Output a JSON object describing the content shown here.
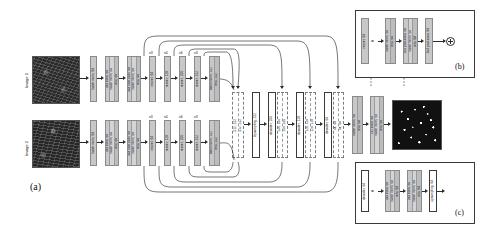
{
  "figure": {
    "type": "neural-network-architecture-diagram",
    "panels": [
      {
        "id": "a",
        "label": "(a)"
      },
      {
        "id": "b",
        "label": "(b)"
      },
      {
        "id": "c",
        "label": "(c)"
      }
    ]
  },
  "inputs": [
    {
      "name": "image-1",
      "label": "Image 1"
    },
    {
      "name": "image-2",
      "label": "Image 2"
    }
  ],
  "encoder": {
    "stem": [
      {
        "lines": [
          "batch norm, 64"
        ]
      },
      {
        "lines": [
          "3x3 conv, 64",
          "batch norm, 64",
          "relu, 64"
        ]
      },
      {
        "lines": [
          "3x3 post-pool, 64",
          "batch norm, 64",
          "relu, 64"
        ]
      }
    ],
    "stages": [
      {
        "label": "resnet, 64",
        "repeat": "x3"
      },
      {
        "label": "resnet, 128",
        "repeat": "x4"
      },
      {
        "label": "resnet, 256",
        "repeat": "x6"
      },
      {
        "label": "resnet, 512",
        "repeat": "x3"
      }
    ],
    "tail": {
      "lines": [
        "batch norm, 512",
        "relu, 512"
      ]
    }
  },
  "bridge": {
    "concat": {
      "lines": [
        "512, 512"
      ]
    },
    "upsample": {
      "label": "Upsampling, 512"
    }
  },
  "decoder": [
    {
      "decoder": "decoder, 256",
      "concat": [
        "256, 256"
      ]
    },
    {
      "decoder": "decoder, 128",
      "concat": [
        "128, 128"
      ]
    },
    {
      "decoder": "decoder, 64",
      "concat": [
        "64, 64"
      ]
    }
  ],
  "head": [
    {
      "lines": [
        "batch norm, 64",
        "relu, 64"
      ]
    },
    {
      "lines": [
        "1x1 conv, 64",
        "batch norm, 64",
        "relu, 64"
      ]
    }
  ],
  "output": {
    "name": "output-map"
  },
  "panel_b": {
    "title": "resnet, 64",
    "equals": "=",
    "blocks": [
      {
        "lines": [
          "batch norm, 64",
          "relu, 64"
        ]
      },
      {
        "lines": [
          "3x3 post-conv, 64",
          "batch norm, 64",
          "relu, 64"
        ]
      },
      {
        "lines": [
          "3x3 post-conv, 64"
        ]
      }
    ],
    "sum_icon": "plus-circle-icon"
  },
  "panel_c": {
    "title": "decoder, 64",
    "equals": "=",
    "blocks": [
      {
        "lines": [
          "3x3 conv, 64",
          "batch norm, 64",
          "relu, 64"
        ]
      },
      {
        "lines": [
          "3x3 conv, 64",
          "batch norm, 64",
          "relu, 64"
        ]
      },
      {
        "lines": [
          "upsampling, 64"
        ]
      }
    ]
  },
  "colors": {
    "block_gray": "#c8c8c8",
    "block_gray_light": "#d4d4d4",
    "arrow": "#2b2b2b",
    "border": "#8a8a8a",
    "background": "#ffffff"
  }
}
